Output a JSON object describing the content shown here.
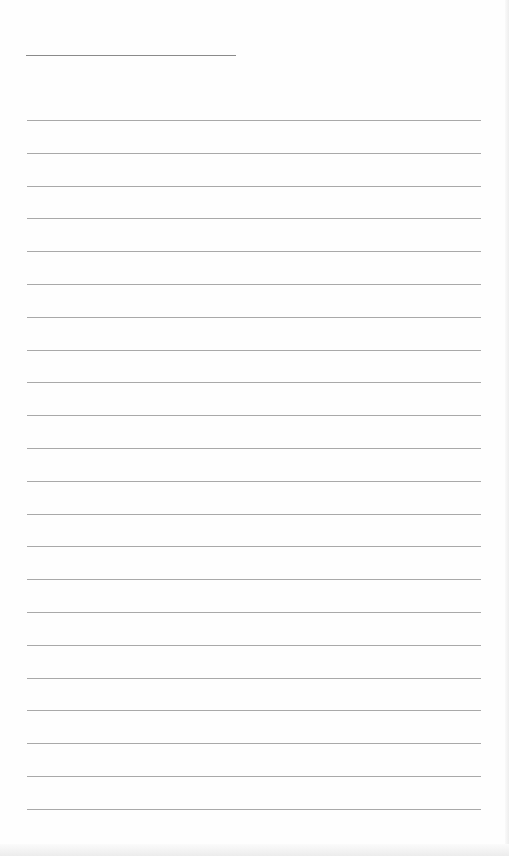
{
  "document": {
    "type": "ruled-sheet",
    "background": "#fefefe",
    "line_color": "#9a9a9a",
    "title_line": {
      "left": 26,
      "top": 55,
      "width": 210
    },
    "rules": {
      "count": 22,
      "left": 27,
      "width": 454,
      "first_top": 120,
      "spacing": 32.8
    },
    "text_content": []
  }
}
